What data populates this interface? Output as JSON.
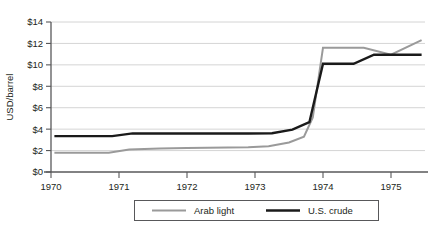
{
  "chart_data": {
    "type": "line",
    "title": "",
    "subtitle": "",
    "xlabel": "",
    "ylabel": "USD/barrel",
    "xlim": [
      1970.0,
      1975.5
    ],
    "ylim": [
      0,
      14
    ],
    "grid": true,
    "legend_position": "bottom",
    "xticks": [
      "1970",
      "1971",
      "1972",
      "1973",
      "1974",
      "1975"
    ],
    "xtick_values": [
      1970,
      1971,
      1972,
      1973,
      1974,
      1975
    ],
    "yticks": [
      "$0",
      "$2",
      "$4",
      "$6",
      "$8",
      "$10",
      "$12",
      "$14"
    ],
    "ytick_values": [
      0,
      2,
      4,
      6,
      8,
      10,
      12,
      14
    ],
    "series": [
      {
        "name": "Arab light",
        "color": "#9a9a9a",
        "width": 2.0,
        "x": [
          1970.05,
          1970.85,
          1971.15,
          1971.6,
          1972.0,
          1972.9,
          1973.2,
          1973.5,
          1973.72,
          1973.85,
          1974.0,
          1974.6,
          1975.0,
          1975.45
        ],
        "y": [
          1.8,
          1.8,
          2.1,
          2.2,
          2.25,
          2.3,
          2.4,
          2.75,
          3.3,
          5.1,
          11.6,
          11.6,
          10.95,
          12.3
        ]
      },
      {
        "name": "U.S. crude",
        "color": "#1a1a1a",
        "width": 2.4,
        "x": [
          1970.05,
          1970.9,
          1971.2,
          1971.6,
          1972.0,
          1972.9,
          1973.25,
          1973.55,
          1973.8,
          1974.0,
          1974.45,
          1974.75,
          1975.0,
          1975.45
        ],
        "y": [
          3.35,
          3.35,
          3.6,
          3.6,
          3.6,
          3.6,
          3.62,
          3.95,
          4.65,
          10.1,
          10.1,
          10.95,
          10.95,
          10.95
        ]
      }
    ],
    "legend": [
      {
        "label": "Arab light",
        "color": "#9a9a9a",
        "width": 2.0
      },
      {
        "label": "U.S. crude",
        "color": "#1a1a1a",
        "width": 2.6
      }
    ]
  }
}
